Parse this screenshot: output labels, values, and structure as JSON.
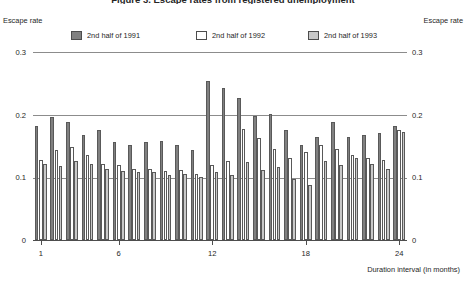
{
  "chart_data": {
    "type": "bar",
    "title": "Figure 3.  Escape rates from registered unemployment",
    "xlabel": "Duration interval (in months)",
    "ylabel": "Escape rate",
    "ylabel_right": "Escape rate",
    "ylim": [
      0,
      0.3
    ],
    "yticks": [
      "0",
      "0.1",
      "0.2",
      "0.3"
    ],
    "ytick_values": [
      0,
      0.1,
      0.2,
      0.3
    ],
    "xticks": [
      "1",
      "6",
      "12",
      "18",
      "24"
    ],
    "xtick_values": [
      1,
      6,
      12,
      18,
      24
    ],
    "grid": true,
    "legend_position": "top",
    "categories": [
      1,
      2,
      3,
      4,
      5,
      6,
      7,
      8,
      9,
      10,
      11,
      12,
      13,
      14,
      15,
      16,
      17,
      18,
      19,
      20,
      21,
      22,
      23,
      24
    ],
    "series": [
      {
        "name": "2nd half of 1991",
        "color": "#808080",
        "values": [
          0.182,
          0.196,
          0.188,
          0.167,
          0.176,
          0.156,
          0.151,
          0.156,
          0.158,
          0.152,
          0.144,
          0.254,
          0.242,
          0.226,
          0.198,
          0.201,
          0.176,
          0.152,
          0.164,
          0.188,
          0.164,
          0.167,
          0.17,
          0.182
        ]
      },
      {
        "name": "2nd half of 1992",
        "color": "#ffffff",
        "values": [
          0.128,
          0.143,
          0.148,
          0.136,
          0.121,
          0.119,
          0.113,
          0.113,
          0.11,
          0.112,
          0.106,
          0.12,
          0.126,
          0.177,
          0.163,
          0.146,
          0.131,
          0.14,
          0.151,
          0.146,
          0.136,
          0.131,
          0.128,
          0.176
        ]
      },
      {
        "name": "2nd half of 1993",
        "color": "#c8c8c8",
        "values": [
          0.122,
          0.118,
          0.126,
          0.121,
          0.113,
          0.11,
          0.108,
          0.108,
          0.104,
          0.106,
          0.101,
          0.108,
          0.104,
          0.125,
          0.112,
          0.116,
          0.098,
          0.088,
          0.126,
          0.12,
          0.131,
          0.121,
          0.113,
          0.172
        ]
      }
    ]
  }
}
